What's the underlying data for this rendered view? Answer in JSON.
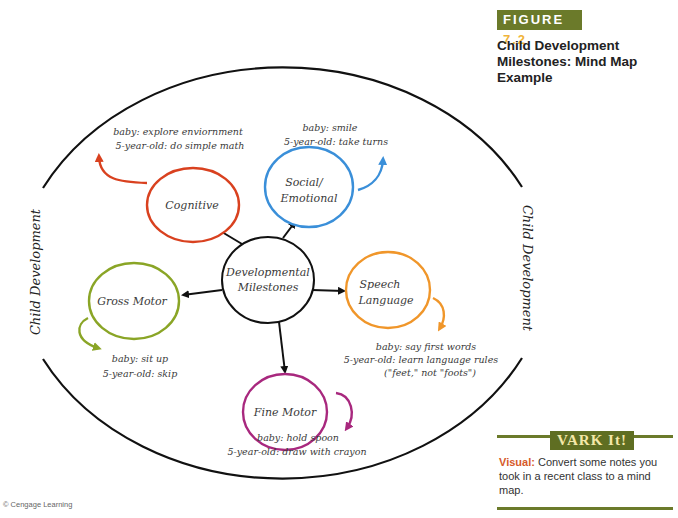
{
  "figure": {
    "badge_label": "FIGURE",
    "badge_number": "7.2",
    "title": "Child Development Milestones: Mind Map Example"
  },
  "mind_map": {
    "side_label_left": "Child Development",
    "side_label_right": "Child Development",
    "center": {
      "line1": "Developmental",
      "line2": "Milestones"
    },
    "nodes": {
      "cognitive": {
        "label": "Cognitive",
        "color": "#d9411f",
        "note_baby": "baby: explore enviornment",
        "note_five": "5-year-old: do simple math"
      },
      "social": {
        "label_line1": "Social/",
        "label_line2": "Emotional",
        "color": "#3a8fd9",
        "note_baby": "baby: smile",
        "note_five": "5-year-old: take turns"
      },
      "gross_motor": {
        "label": "Gross Motor",
        "color": "#8aa526",
        "note_baby": "baby: sit up",
        "note_five": "5-year-old: skip"
      },
      "speech": {
        "label_line1": "Speech",
        "label_line2": "Language",
        "color": "#f0962a",
        "note_baby": "baby: say first words",
        "note_five": "5-year-old: learn language rules",
        "note_extra": "(\"feet,\" not \"foots\")"
      },
      "fine_motor": {
        "label": "Fine Motor",
        "color": "#a8287e",
        "note_baby": "baby: hold spoon",
        "note_five": "5-year-old: draw with crayon"
      }
    }
  },
  "vark": {
    "badge": "VARK It!",
    "keyword": "Visual:",
    "text": " Convert some notes you took in a recent class to a mind map.",
    "accent_color": "#6b7a2a"
  },
  "credit": "© Cengage Learning"
}
